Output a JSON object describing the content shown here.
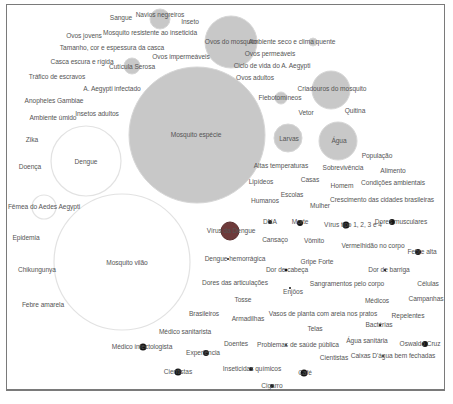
{
  "diagram": {
    "type": "bubble-word-map",
    "colors": {
      "frame": "#7a7a7a",
      "bubble_gray": "#c8c8c8",
      "bubble_outline_white": "#e2e2e2",
      "bubble_dark_red": "#6e3a3a",
      "dot_black": "#141414",
      "text": "#555555"
    },
    "bubbles": [
      {
        "id": "mosquito-especie",
        "label": "Mosquito espécie",
        "cx": 197,
        "cy": 135,
        "r": 68,
        "fill": "gray"
      },
      {
        "id": "mosquito-vilao",
        "label": "Mosquito vilão",
        "cx": 122,
        "cy": 262,
        "r": 68,
        "fill": "white"
      },
      {
        "id": "dengue",
        "label": "Dengue",
        "cx": 86,
        "cy": 161,
        "r": 35,
        "fill": "white"
      },
      {
        "id": "ovos-do-mosquito",
        "label": "Ovos do mosquito",
        "cx": 231,
        "cy": 42,
        "r": 26,
        "fill": "gray"
      },
      {
        "id": "criadouros",
        "label": "Criadouros do mosquito",
        "cx": 331,
        "cy": 90,
        "r": 19,
        "fill": "gray"
      },
      {
        "id": "agua",
        "label": "Água",
        "cx": 338,
        "cy": 141,
        "r": 19,
        "fill": "gray"
      },
      {
        "id": "larvas",
        "label": "Larvas",
        "cx": 288,
        "cy": 138,
        "r": 14,
        "fill": "gray"
      },
      {
        "id": "navios-negreiros",
        "label": "Navios negreiros",
        "cx": 160,
        "cy": 19,
        "r": 10,
        "fill": "gray"
      },
      {
        "id": "cuticula-serosa",
        "label": "Cutícula Serosa",
        "cx": 132,
        "cy": 66,
        "r": 8,
        "fill": "gray"
      },
      {
        "id": "flebotomineos",
        "label": "Flebotomíneos",
        "cx": 281,
        "cy": 98,
        "r": 6,
        "fill": "gray"
      },
      {
        "id": "ambiente-seco",
        "label": "Ambiente seco e clima quente",
        "cx": 313,
        "cy": 42,
        "r": 4,
        "fill": "gray"
      },
      {
        "id": "femea-aedes",
        "label": "Fêmea do Aedes Aegypti",
        "cx": 44,
        "cy": 207,
        "r": 12,
        "fill": "white"
      },
      {
        "id": "virus-dengue",
        "label": "Vírus da Dengue",
        "cx": 230,
        "cy": 231,
        "r": 9,
        "fill": "dark"
      }
    ],
    "dots": [
      {
        "label": "DNA",
        "cx": 270,
        "cy": 222,
        "r": 2
      },
      {
        "label": "Morte",
        "cx": 300,
        "cy": 223,
        "r": 3
      },
      {
        "label": "Vírus tipo 1, 2, 3 e 4",
        "cx": 346,
        "cy": 225,
        "r": 3.5
      },
      {
        "label": "Dores musculares",
        "cx": 392,
        "cy": 222,
        "r": 3
      },
      {
        "label": "Febre alta",
        "cx": 418,
        "cy": 252,
        "r": 3
      },
      {
        "label": "Dor de cabeça",
        "cx": 286,
        "cy": 270,
        "r": 1.5
      },
      {
        "label": "Dor de barriga",
        "cx": 385,
        "cy": 270,
        "r": 1.2
      },
      {
        "label": "Dengue hemorrágica",
        "cx": 228,
        "cy": 259,
        "r": 1
      },
      {
        "label": "Enjôos",
        "cx": 290,
        "cy": 288,
        "r": 1
      },
      {
        "label": "Bactérias",
        "cx": 380,
        "cy": 325,
        "r": 1.2
      },
      {
        "label": "Oswaldo Cruz",
        "cx": 425,
        "cy": 344,
        "r": 3
      },
      {
        "label": "Caixas D'água bem fechadas",
        "cx": 383,
        "cy": 356,
        "r": 1
      },
      {
        "label": "Problemas de saúde pública",
        "cx": 286,
        "cy": 345,
        "r": 1
      },
      {
        "label": "Médico infectologista",
        "cx": 143,
        "cy": 347,
        "r": 3.5
      },
      {
        "label": "Experiência",
        "cx": 206,
        "cy": 353,
        "r": 3
      },
      {
        "label": "Inseticidas químicos",
        "cx": 251,
        "cy": 369,
        "r": 2
      },
      {
        "label": "Café",
        "cx": 304,
        "cy": 373,
        "r": 3.5
      },
      {
        "label": "Cientistas",
        "cx": 178,
        "cy": 372,
        "r": 3.5
      },
      {
        "label": "Cigarro",
        "cx": 272,
        "cy": 386,
        "r": 2
      }
    ],
    "labels": [
      {
        "text": "Sangue",
        "x": 121,
        "y": 18
      },
      {
        "text": "Navios negreiros",
        "x": 160,
        "y": 15
      },
      {
        "text": "Inseto",
        "x": 190,
        "y": 22
      },
      {
        "text": "Mosquito resistente ao inseticida",
        "x": 150,
        "y": 33
      },
      {
        "text": "Ovos jovens",
        "x": 84,
        "y": 36
      },
      {
        "text": "Tamanho, cor e espessura da casca",
        "x": 112,
        "y": 48
      },
      {
        "text": "Ovos impermeáveis",
        "x": 181,
        "y": 57
      },
      {
        "text": "Casca escura e rígida",
        "x": 82,
        "y": 62
      },
      {
        "text": "Cutícula Serosa",
        "x": 132,
        "y": 67
      },
      {
        "text": "Tráfico de escravos",
        "x": 57,
        "y": 77
      },
      {
        "text": "A. Aegypti infectado",
        "x": 112,
        "y": 89
      },
      {
        "text": "Anopheles Gambiae",
        "x": 54,
        "y": 101
      },
      {
        "text": "Ambiente úmido",
        "x": 53,
        "y": 118
      },
      {
        "text": "Insetos adultos",
        "x": 97,
        "y": 114
      },
      {
        "text": "Ovos do mosquito",
        "x": 231,
        "y": 42
      },
      {
        "text": "Ambiente seco e clima quente",
        "x": 292,
        "y": 42
      },
      {
        "text": "Ovos permeáveis",
        "x": 270,
        "y": 54
      },
      {
        "text": "Ciclo de vida do A. Aegypti",
        "x": 272,
        "y": 66
      },
      {
        "text": "Ovos adultos",
        "x": 255,
        "y": 78
      },
      {
        "text": "Criadouros do mosquito",
        "x": 332,
        "y": 89
      },
      {
        "text": "Flebotomíneos",
        "x": 280,
        "y": 98
      },
      {
        "text": "Vetor",
        "x": 306,
        "y": 113
      },
      {
        "text": "Quitina",
        "x": 355,
        "y": 111
      },
      {
        "text": "Mosquito espécie",
        "x": 196,
        "y": 135
      },
      {
        "text": "Larvas",
        "x": 289,
        "y": 139
      },
      {
        "text": "Água",
        "x": 339,
        "y": 141
      },
      {
        "text": "Zika",
        "x": 32,
        "y": 140
      },
      {
        "text": "Dengue",
        "x": 86,
        "y": 162
      },
      {
        "text": "Doença",
        "x": 30,
        "y": 167
      },
      {
        "text": "População",
        "x": 377,
        "y": 156
      },
      {
        "text": "Altas temperaturas",
        "x": 281,
        "y": 166
      },
      {
        "text": "Sobrevivência",
        "x": 343,
        "y": 168
      },
      {
        "text": "Alimento",
        "x": 393,
        "y": 171
      },
      {
        "text": "Lipídeos",
        "x": 261,
        "y": 182
      },
      {
        "text": "Casas",
        "x": 310,
        "y": 180
      },
      {
        "text": "Homem",
        "x": 342,
        "y": 186
      },
      {
        "text": "Condições ambientais",
        "x": 393,
        "y": 183
      },
      {
        "text": "Escolas",
        "x": 292,
        "y": 195
      },
      {
        "text": "Crescimento das cidades brasileiras",
        "x": 382,
        "y": 200
      },
      {
        "text": "Humanos",
        "x": 265,
        "y": 201
      },
      {
        "text": "Mulher",
        "x": 320,
        "y": 206
      },
      {
        "text": "Fêmea do Aedes Aegypti",
        "x": 44,
        "y": 207
      },
      {
        "text": "DNA",
        "x": 270,
        "y": 222
      },
      {
        "text": "Morte",
        "x": 300,
        "y": 222
      },
      {
        "text": "Vírus tipo 1, 2, 3 e 4",
        "x": 353,
        "y": 225
      },
      {
        "text": "Dores musculares",
        "x": 401,
        "y": 222
      },
      {
        "text": "Vírus da Dengue",
        "x": 231,
        "y": 231
      },
      {
        "text": "Epidemia",
        "x": 26,
        "y": 238
      },
      {
        "text": "Cansaço",
        "x": 275,
        "y": 240
      },
      {
        "text": "Vômito",
        "x": 314,
        "y": 241
      },
      {
        "text": "Mosquito vilão",
        "x": 127,
        "y": 263
      },
      {
        "text": "Vermelhidão no corpo",
        "x": 373,
        "y": 246
      },
      {
        "text": "Febre alta",
        "x": 422,
        "y": 252
      },
      {
        "text": "Dengue hemorrágica",
        "x": 235,
        "y": 259
      },
      {
        "text": "Gripe Forte",
        "x": 317,
        "y": 262
      },
      {
        "text": "Chikungunya",
        "x": 37,
        "y": 270
      },
      {
        "text": "Dor de cabeça",
        "x": 287,
        "y": 270
      },
      {
        "text": "Dor de barriga",
        "x": 389,
        "y": 270
      },
      {
        "text": "Dores das articulações",
        "x": 235,
        "y": 283
      },
      {
        "text": "Sangramentos pelo corpo",
        "x": 347,
        "y": 284
      },
      {
        "text": "Células",
        "x": 428,
        "y": 284
      },
      {
        "text": "Enjôos",
        "x": 293,
        "y": 292
      },
      {
        "text": "Febre amarela",
        "x": 43,
        "y": 305
      },
      {
        "text": "Tosse",
        "x": 243,
        "y": 300
      },
      {
        "text": "Médicos",
        "x": 377,
        "y": 301
      },
      {
        "text": "Campanhas",
        "x": 426,
        "y": 299
      },
      {
        "text": "Brasileiros",
        "x": 204,
        "y": 314
      },
      {
        "text": "Armadilhas",
        "x": 248,
        "y": 319
      },
      {
        "text": "Vasos de planta com areia nos pratos",
        "x": 323,
        "y": 314
      },
      {
        "text": "Repelentes",
        "x": 408,
        "y": 316
      },
      {
        "text": "Bactérias",
        "x": 379,
        "y": 325
      },
      {
        "text": "Médico sanitarista",
        "x": 185,
        "y": 332
      },
      {
        "text": "Telas",
        "x": 315,
        "y": 329
      },
      {
        "text": "Água sanitária",
        "x": 367,
        "y": 341
      },
      {
        "text": "Oswaldo Cruz",
        "x": 420,
        "y": 344
      },
      {
        "text": "Doentes",
        "x": 236,
        "y": 344
      },
      {
        "text": "Problemas de saúde pública",
        "x": 298,
        "y": 345
      },
      {
        "text": "Médico infectologista",
        "x": 142,
        "y": 347
      },
      {
        "text": "Experiência",
        "x": 203,
        "y": 353
      },
      {
        "text": "Cientistas",
        "x": 334,
        "y": 358
      },
      {
        "text": "Caixas D'água bem fechadas",
        "x": 393,
        "y": 356
      },
      {
        "text": "Inseticidas químicos",
        "x": 252,
        "y": 369
      },
      {
        "text": "Café",
        "x": 305,
        "y": 373
      },
      {
        "text": "Cientistas",
        "x": 178,
        "y": 372
      },
      {
        "text": "Cigarro",
        "x": 272,
        "y": 386
      }
    ]
  }
}
